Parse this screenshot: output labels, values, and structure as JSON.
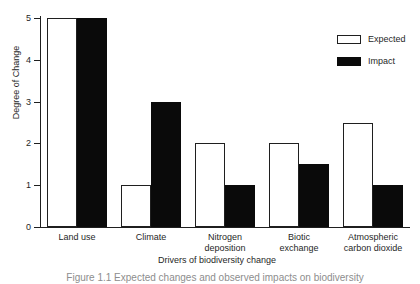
{
  "chart_data": {
    "type": "bar",
    "title": "",
    "xlabel": "Drivers of biodiversity change",
    "ylabel": "Degree of Change",
    "categories": [
      "Land use",
      "Climate",
      "Nitrogen deposition",
      "Biotic exchange",
      "Atmospheric carbon dioxide"
    ],
    "category_lines": [
      [
        "Land use"
      ],
      [
        "Climate"
      ],
      [
        "Nitrogen",
        "deposition"
      ],
      [
        "Biotic",
        "exchange"
      ],
      [
        "Atmospheric",
        "carbon dioxide"
      ]
    ],
    "series": [
      {
        "name": "Expected",
        "values": [
          5,
          1,
          2,
          2,
          2.5
        ],
        "fill": "#ffffff",
        "stroke": "#1f1f1f"
      },
      {
        "name": "Impact",
        "values": [
          5,
          3,
          1,
          1.5,
          1
        ],
        "fill": "#0a0a0a",
        "stroke": "#0a0a0a"
      }
    ],
    "ylim": [
      0,
      5
    ],
    "yticks": [
      0,
      1,
      2,
      3,
      4,
      5
    ],
    "ytick_labels": [
      "0",
      "1",
      "2",
      "3",
      "4",
      "5"
    ],
    "grid": false,
    "legend_position": "top-right"
  },
  "legend": {
    "items": [
      {
        "label": "Expected"
      },
      {
        "label": "Impact"
      }
    ]
  },
  "caption": {
    "text": "Figure 1.1  Expected changes and observed impacts on biodiversity"
  },
  "colors": {
    "axis": "#1f1f1f",
    "expected_fill": "#ffffff",
    "impact_fill": "#0a0a0a",
    "background": "#ffffff"
  }
}
